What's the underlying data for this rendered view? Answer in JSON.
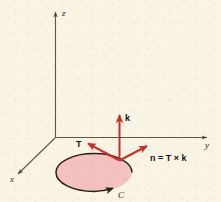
{
  "figure": {
    "caption_visible": false,
    "background_color": "#faf4e4",
    "axes": [
      {
        "id": "z",
        "label": "z",
        "x": 62,
        "y": 13
      },
      {
        "id": "y",
        "label": "y",
        "x": 206,
        "y": 145
      },
      {
        "id": "x",
        "label": "x",
        "x": 12,
        "y": 180
      }
    ],
    "vectors": [
      {
        "id": "k",
        "label": "k",
        "x": 126,
        "y": 118,
        "color": "#cf2b2b"
      },
      {
        "id": "T",
        "label": "T",
        "x": 78,
        "y": 145,
        "color": "#cf2b2b"
      },
      {
        "id": "n",
        "label": "n = T × k",
        "x": 149,
        "y": 158,
        "color": "#cf2b2b"
      }
    ],
    "curve": {
      "id": "C",
      "label": "C",
      "label_x": 120,
      "label_y": 196,
      "fill_color": "#f3c2c0",
      "stroke_color": "#241d18",
      "orientation": "counterclockwise-from-above"
    },
    "axis_color": "#5d564b",
    "arrow_color": "#cf2b2b"
  }
}
